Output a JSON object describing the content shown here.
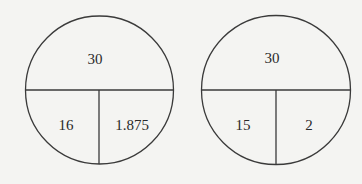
{
  "diagrams": [
    {
      "name": "left-circle",
      "top": "30",
      "bottom_left": "16",
      "bottom_right": "1.875"
    },
    {
      "name": "right-circle",
      "top": "30",
      "bottom_left": "15",
      "bottom_right": "2"
    }
  ],
  "colors": {
    "background": "#f4f4f2",
    "stroke": "#3a3a3a",
    "text": "#2a2a2a"
  }
}
